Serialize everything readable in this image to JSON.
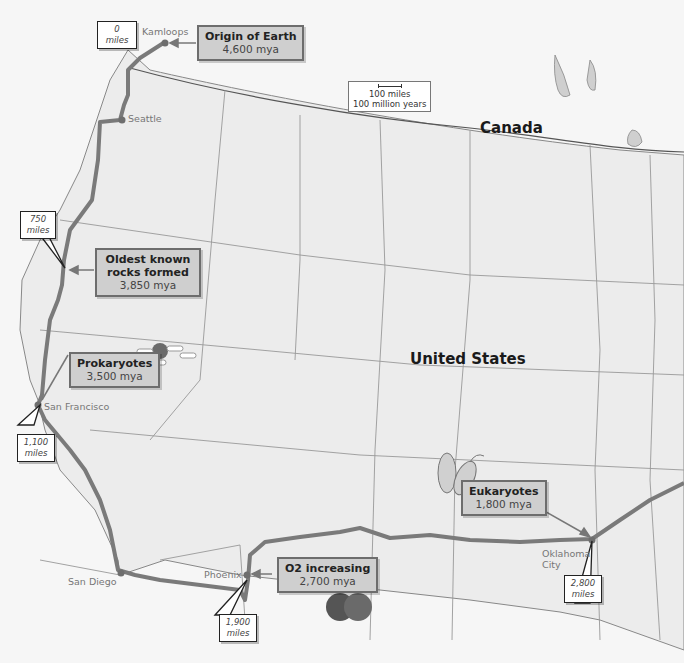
{
  "map": {
    "countries": {
      "canada": "Canada",
      "united_states": "United States"
    },
    "scale": {
      "line1": "100 miles",
      "line2": "100 million years"
    },
    "cities": [
      {
        "name": "Kamloops"
      },
      {
        "name": "Seattle"
      },
      {
        "name": "San Francisco"
      },
      {
        "name": "San Diego"
      },
      {
        "name": "Phoenix"
      },
      {
        "name": "Oklahoma City"
      }
    ],
    "events": [
      {
        "title": "Origin of Earth",
        "value": "4,600 mya"
      },
      {
        "title": "Oldest known rocks formed",
        "value": "3,850 mya"
      },
      {
        "title": "Prokaryotes",
        "value": "3,500 mya"
      },
      {
        "title": "O2 increasing",
        "value": "2,700 mya"
      },
      {
        "title": "Eukaryotes",
        "value": "1,800 mya"
      }
    ],
    "mile_markers": [
      {
        "num": "0",
        "unit": "miles"
      },
      {
        "num": "750",
        "unit": "miles"
      },
      {
        "num": "1,100",
        "unit": "miles"
      },
      {
        "num": "1,900",
        "unit": "miles"
      },
      {
        "num": "2,800",
        "unit": "miles"
      }
    ],
    "colors": {
      "route": "#7a7a7a",
      "land": "#ececec",
      "borders": "#8a8a8a",
      "box_fill": "#cfcfcf"
    }
  }
}
